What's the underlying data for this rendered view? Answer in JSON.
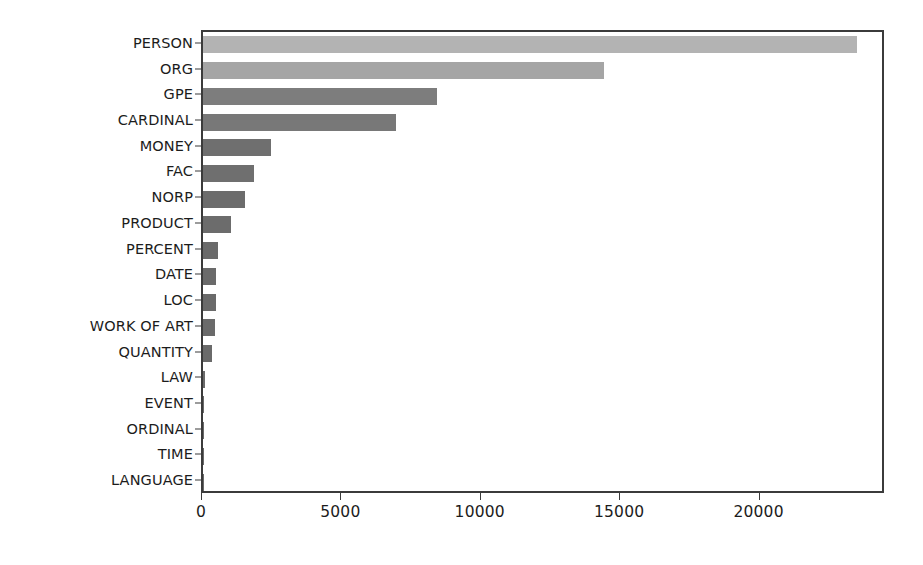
{
  "chart_data": {
    "type": "bar",
    "orientation": "horizontal",
    "title": "",
    "subtitle": "",
    "xlabel": "",
    "ylabel": "",
    "categories": [
      "PERSON",
      "ORG",
      "GPE",
      "CARDINAL",
      "MONEY",
      "FAC",
      "NORP",
      "PRODUCT",
      "PERCENT",
      "DATE",
      "LOC",
      "WORK OF ART",
      "QUANTITY",
      "LAW",
      "EVENT",
      "ORDINAL",
      "TIME",
      "LANGUAGE"
    ],
    "values": [
      23450,
      14400,
      8400,
      6930,
      2440,
      1830,
      1510,
      1005,
      540,
      470,
      470,
      430,
      320,
      60,
      40,
      30,
      25,
      15
    ],
    "bar_colors": [
      "#b3b3b3",
      "#a5a5a5",
      "#7d7d7d",
      "#787878",
      "#6f6f6f",
      "#6f6f6f",
      "#6c6c6c",
      "#6c6c6c",
      "#6a6a6a",
      "#6a6a6a",
      "#6a6a6a",
      "#6a6a6a",
      "#6a6a6a",
      "#6a6a6a",
      "#6a6a6a",
      "#6a6a6a",
      "#6a6a6a",
      "#6a6a6a"
    ],
    "xlim": [
      0,
      24500
    ],
    "ylim_categories_count": 18,
    "xticks": [
      0,
      5000,
      10000,
      15000,
      20000
    ],
    "xticklabels": [
      "0",
      "5000",
      "10000",
      "15000",
      "20000"
    ],
    "grid": false,
    "legend": false,
    "legend_position": "none",
    "frame_color": "#3b3b3b",
    "background_color": "#ffffff"
  }
}
